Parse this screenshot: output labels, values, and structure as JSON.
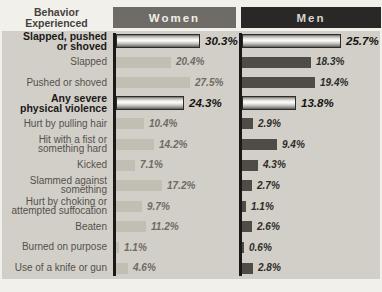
{
  "header": {
    "behavior_line1": "Behavior",
    "behavior_line2": "Experienced",
    "women": "Women",
    "men": "Men"
  },
  "chart_data": {
    "type": "bar",
    "orientation": "horizontal",
    "value_suffix": "%",
    "categories": [
      "Slapped, pushed\nor shoved",
      "Slapped",
      "Pushed or shoved",
      "Any severe\nphysical violence",
      "Hurt by pulling hair",
      "Hit with a fist or\nsomething hard",
      "Kicked",
      "Slammed against\nsomething",
      "Hurt by choking or\nattempted suffocation",
      "Beaten",
      "Burned on purpose",
      "Use of a knife or gun"
    ],
    "series": [
      {
        "name": "Women",
        "values": [
          30.3,
          20.4,
          27.5,
          24.3,
          10.4,
          14.2,
          7.1,
          17.2,
          9.7,
          11.2,
          1.1,
          4.6
        ]
      },
      {
        "name": "Men",
        "values": [
          25.7,
          18.3,
          19.4,
          13.8,
          2.9,
          9.4,
          4.3,
          2.7,
          1.1,
          2.6,
          0.6,
          2.8
        ]
      }
    ],
    "emphasized_rows": [
      0,
      3
    ],
    "layout": {
      "legend_position": "column-headers-top",
      "grid": false,
      "women_px_per_percent": 2.7,
      "men_px_per_percent": 3.77,
      "women_bar_origin_px": 114,
      "men_bar_origin_px": 240
    },
    "colors": {
      "page_bg": "#f2f0ea",
      "panel_bg": "#d2cfc8",
      "women_header_bg": "#6f6b66",
      "men_header_bg": "#2a2826",
      "women_bar": "#c1beb4",
      "men_bar": "#4f4c47",
      "axis_line": "#1b1917",
      "women_value_text": "#6e6b64",
      "men_value_text": "#2d2b28",
      "emphasis_value_text": "#141311"
    }
  }
}
